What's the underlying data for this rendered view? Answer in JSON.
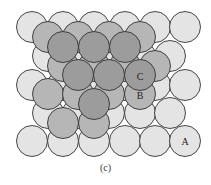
{
  "figure": {
    "caption": "(c)",
    "layers": {
      "A": {
        "label": "A",
        "fill": "#e4e4e4",
        "label_pos": [
          185,
          141
        ],
        "radius": 15.5,
        "spheres": [
          [
            32,
            27
          ],
          [
            63,
            27
          ],
          [
            94,
            27
          ],
          [
            125,
            27
          ],
          [
            155,
            27
          ],
          [
            185,
            27
          ],
          [
            48,
            56
          ],
          [
            78,
            56
          ],
          [
            109,
            56
          ],
          [
            140,
            56
          ],
          [
            170,
            56
          ],
          [
            32,
            85
          ],
          [
            63,
            85
          ],
          [
            94,
            85
          ],
          [
            125,
            85
          ],
          [
            155,
            85
          ],
          [
            185,
            85
          ],
          [
            48,
            113
          ],
          [
            78,
            113
          ],
          [
            109,
            113
          ],
          [
            140,
            113
          ],
          [
            170,
            113
          ],
          [
            32,
            141
          ],
          [
            63,
            141
          ],
          [
            94,
            141
          ],
          [
            125,
            141
          ],
          [
            155,
            141
          ],
          [
            185,
            141
          ]
        ]
      },
      "B": {
        "label": "B",
        "fill": "#b6b6b6",
        "label_pos": [
          140,
          95
        ],
        "radius": 15.5,
        "spheres": [
          [
            48,
            37
          ],
          [
            78,
            37
          ],
          [
            109,
            37
          ],
          [
            140,
            37
          ],
          [
            155,
            66
          ],
          [
            63,
            66
          ],
          [
            94,
            66
          ],
          [
            125,
            66
          ],
          [
            48,
            94
          ],
          [
            78,
            94
          ],
          [
            109,
            94
          ],
          [
            140,
            94
          ],
          [
            63,
            123
          ],
          [
            94,
            123
          ]
        ]
      },
      "C": {
        "label": "C",
        "fill": "#9c9c9c",
        "label_pos": [
          140,
          76
        ],
        "radius": 15.5,
        "spheres": [
          [
            63,
            47
          ],
          [
            94,
            47
          ],
          [
            125,
            47
          ],
          [
            78,
            75
          ],
          [
            109,
            75
          ],
          [
            140,
            75
          ],
          [
            94,
            104
          ]
        ]
      }
    },
    "stroke": "#333333"
  }
}
